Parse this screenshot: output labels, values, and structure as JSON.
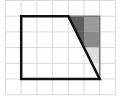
{
  "diagram": {
    "type": "grid-geometry",
    "grid": {
      "columns": 7,
      "rows": 6,
      "line_color": "#d9d9d9"
    },
    "trapezoid": {
      "vertices_grid": [
        [
          1,
          1
        ],
        [
          4,
          1
        ],
        [
          6,
          5
        ],
        [
          1,
          5
        ]
      ],
      "stroke_color": "#111111"
    },
    "shaded_region": {
      "vertices_grid": [
        [
          4,
          1
        ],
        [
          6,
          1
        ],
        [
          6,
          5
        ]
      ],
      "cells": [
        {
          "col": 4,
          "row": 1,
          "color": "#5e5e5e"
        },
        {
          "col": 5,
          "row": 1,
          "color": "#9a9a9a"
        },
        {
          "col": 4,
          "row": 2,
          "color": "#5e5e5e"
        },
        {
          "col": 5,
          "row": 2,
          "color": "#8a8a8a"
        },
        {
          "col": 5,
          "row": 3,
          "color": "#dedede"
        },
        {
          "col": 5,
          "row": 4,
          "color": "#f2f2f2"
        }
      ],
      "outline_color": "#777777"
    }
  }
}
